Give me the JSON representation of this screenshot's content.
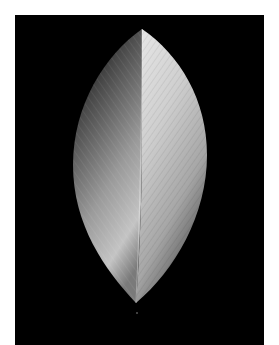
{
  "caption": {
    "text": " "
  },
  "image": {
    "subject": "leaf-shaped sculpture photograph, black background",
    "background_color": "#000000",
    "left_half_gradient": [
      "#1a1a1a",
      "#bfbfbf"
    ],
    "right_half_gradient": [
      "#e6e6e6",
      "#8a8a8a"
    ]
  }
}
